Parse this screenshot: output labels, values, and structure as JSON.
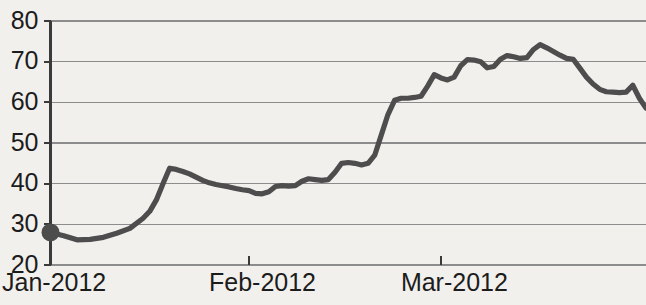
{
  "chart_data": {
    "type": "line",
    "title": "",
    "subtitle": "",
    "xlabel": "",
    "ylabel": "",
    "grid": true,
    "legend": false,
    "legend_position": "none",
    "ylim": [
      20,
      80
    ],
    "yticks": [
      20,
      30,
      40,
      50,
      60,
      70,
      80
    ],
    "ytick_labels": [
      "20",
      "30",
      "40",
      "50",
      "60",
      "70",
      "80"
    ],
    "xtick_labels": [
      "Jan-2012",
      "Feb-2012",
      "Mar-2012"
    ],
    "xtick_positions": [
      0,
      30,
      59
    ],
    "xlim": [
      0,
      90
    ],
    "line_color": "#4d4d4d",
    "grid_color": "#8c8c8c",
    "axis_color": "#3a3a3a",
    "background_color": "#f2f0ed",
    "start_marker": {
      "x": 0,
      "y": 28,
      "shape": "circle",
      "color": "#4d4d4d"
    },
    "series": [
      {
        "name": "value",
        "x": [
          0,
          2,
          4,
          6,
          8,
          10,
          12,
          14,
          15,
          16,
          17,
          18,
          19,
          20,
          21,
          22,
          23,
          24,
          25,
          26,
          27,
          28,
          29,
          30,
          31,
          32,
          33,
          34,
          35,
          36,
          37,
          38,
          39,
          40,
          41,
          42,
          43,
          44,
          45,
          46,
          47,
          48,
          49,
          50,
          51,
          52,
          53,
          54,
          55,
          56,
          57,
          58,
          59,
          60,
          61,
          62,
          63,
          64,
          65,
          66,
          67,
          68,
          69,
          70,
          71,
          72,
          73,
          74,
          75,
          76,
          77,
          78,
          79,
          80,
          81,
          82,
          83,
          84,
          85,
          86,
          87,
          88,
          89,
          90
        ],
        "values": [
          28,
          27.2,
          26.2,
          26.3,
          26.8,
          27.8,
          29.0,
          31.5,
          33.2,
          36.0,
          40.0,
          43.8,
          43.5,
          43.0,
          42.4,
          41.6,
          40.8,
          40.2,
          39.8,
          39.5,
          39.2,
          38.8,
          38.5,
          38.3,
          37.6,
          37.5,
          38.0,
          39.3,
          39.5,
          39.4,
          39.5,
          40.6,
          41.2,
          41.0,
          40.8,
          41.0,
          42.8,
          45.0,
          45.2,
          45.0,
          44.6,
          45.0,
          47.0,
          52.0,
          57.0,
          60.5,
          61.0,
          61.0,
          61.2,
          61.5,
          64.0,
          66.8,
          66.0,
          65.5,
          66.2,
          69.0,
          70.5,
          70.4,
          70.0,
          68.5,
          68.8,
          70.6,
          71.5,
          71.2,
          70.8,
          71.0,
          73.0,
          74.2,
          73.4,
          72.5,
          71.6,
          70.8,
          70.6,
          68.4,
          66.2,
          64.5,
          63.2,
          62.6,
          62.5,
          62.4,
          62.5,
          64.2,
          61.0,
          58.6
        ]
      }
    ],
    "annotations": []
  }
}
